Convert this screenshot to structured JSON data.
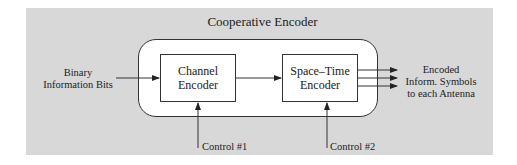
{
  "diagram": {
    "title": "Cooperative Encoder",
    "input_label": [
      "Binary",
      "Information Bits"
    ],
    "blocks": [
      {
        "id": "channel-encoder",
        "label": [
          "Channel",
          "Encoder"
        ]
      },
      {
        "id": "space-time-encoder",
        "label": [
          "Space–Time",
          "Encoder"
        ]
      }
    ],
    "controls": [
      {
        "label": "Control #1",
        "target": "channel-encoder"
      },
      {
        "label": "Control #2",
        "target": "space-time-encoder"
      }
    ],
    "output_label": [
      "Encoded",
      "Inform. Symbols",
      "to each Antenna"
    ],
    "output_arrow_count": 3,
    "colors": {
      "panel": "#d8d8d8",
      "line": "#333333",
      "block_fill": "#ffffff"
    }
  }
}
